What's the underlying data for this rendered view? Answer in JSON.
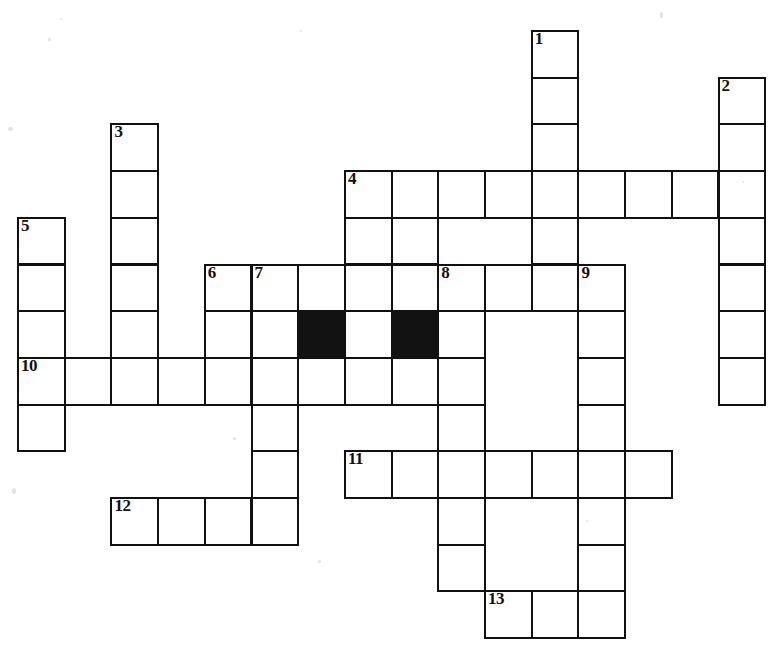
{
  "puzzle": {
    "type": "crossword-grid",
    "title": "Crossword puzzle grid",
    "cell_size": 46.7,
    "origin_x": 17,
    "origin_y": 30,
    "colors": {
      "background": "#ffffff",
      "cell_fill": "#ffffff",
      "block_fill": "#121212",
      "border": "#111111",
      "number": "#111111"
    },
    "numbers_total": 13,
    "numbers": [
      "1",
      "2",
      "3",
      "4",
      "5",
      "6",
      "7",
      "8",
      "9",
      "10",
      "11",
      "12",
      "13"
    ],
    "cells": [
      {
        "c": 11,
        "r": 0,
        "n": "1"
      },
      {
        "c": 11,
        "r": 1,
        "n": ""
      },
      {
        "c": 11,
        "r": 2,
        "n": ""
      },
      {
        "c": 15,
        "r": 1,
        "n": "2"
      },
      {
        "c": 15,
        "r": 2,
        "n": ""
      },
      {
        "c": 2,
        "r": 2,
        "n": "3"
      },
      {
        "c": 2,
        "r": 3,
        "n": ""
      },
      {
        "c": 2,
        "r": 4,
        "n": ""
      },
      {
        "c": 2,
        "r": 5,
        "n": ""
      },
      {
        "c": 2,
        "r": 6,
        "n": ""
      },
      {
        "c": 7,
        "r": 3,
        "n": "4"
      },
      {
        "c": 8,
        "r": 3,
        "n": ""
      },
      {
        "c": 9,
        "r": 3,
        "n": ""
      },
      {
        "c": 10,
        "r": 3,
        "n": ""
      },
      {
        "c": 11,
        "r": 3,
        "n": ""
      },
      {
        "c": 12,
        "r": 3,
        "n": ""
      },
      {
        "c": 13,
        "r": 3,
        "n": ""
      },
      {
        "c": 14,
        "r": 3,
        "n": ""
      },
      {
        "c": 15,
        "r": 3,
        "n": ""
      },
      {
        "c": 7,
        "r": 4,
        "n": ""
      },
      {
        "c": 8,
        "r": 4,
        "n": ""
      },
      {
        "c": 11,
        "r": 4,
        "n": ""
      },
      {
        "c": 15,
        "r": 4,
        "n": ""
      },
      {
        "c": 0,
        "r": 4,
        "n": "5"
      },
      {
        "c": 0,
        "r": 5,
        "n": ""
      },
      {
        "c": 0,
        "r": 6,
        "n": ""
      },
      {
        "c": 4,
        "r": 5,
        "n": "6"
      },
      {
        "c": 5,
        "r": 5,
        "n": "7"
      },
      {
        "c": 6,
        "r": 5,
        "n": ""
      },
      {
        "c": 7,
        "r": 5,
        "n": ""
      },
      {
        "c": 8,
        "r": 5,
        "n": ""
      },
      {
        "c": 9,
        "r": 5,
        "n": "8"
      },
      {
        "c": 10,
        "r": 5,
        "n": ""
      },
      {
        "c": 11,
        "r": 5,
        "n": ""
      },
      {
        "c": 12,
        "r": 5,
        "n": "9"
      },
      {
        "c": 4,
        "r": 6,
        "n": ""
      },
      {
        "c": 5,
        "r": 6,
        "n": ""
      },
      {
        "c": 6,
        "r": 6,
        "n": "",
        "block": true
      },
      {
        "c": 7,
        "r": 6,
        "n": ""
      },
      {
        "c": 8,
        "r": 6,
        "n": "",
        "block": true
      },
      {
        "c": 9,
        "r": 6,
        "n": ""
      },
      {
        "c": 12,
        "r": 6,
        "n": ""
      },
      {
        "c": 15,
        "r": 5,
        "n": ""
      },
      {
        "c": 15,
        "r": 6,
        "n": ""
      },
      {
        "c": 0,
        "r": 7,
        "n": "10"
      },
      {
        "c": 1,
        "r": 7,
        "n": ""
      },
      {
        "c": 2,
        "r": 7,
        "n": ""
      },
      {
        "c": 3,
        "r": 7,
        "n": ""
      },
      {
        "c": 4,
        "r": 7,
        "n": ""
      },
      {
        "c": 5,
        "r": 7,
        "n": ""
      },
      {
        "c": 6,
        "r": 7,
        "n": ""
      },
      {
        "c": 7,
        "r": 7,
        "n": ""
      },
      {
        "c": 8,
        "r": 7,
        "n": ""
      },
      {
        "c": 9,
        "r": 7,
        "n": ""
      },
      {
        "c": 12,
        "r": 7,
        "n": ""
      },
      {
        "c": 15,
        "r": 7,
        "n": ""
      },
      {
        "c": 0,
        "r": 8,
        "n": ""
      },
      {
        "c": 5,
        "r": 8,
        "n": ""
      },
      {
        "c": 9,
        "r": 8,
        "n": ""
      },
      {
        "c": 12,
        "r": 8,
        "n": ""
      },
      {
        "c": 5,
        "r": 9,
        "n": ""
      },
      {
        "c": 9,
        "r": 9,
        "n": ""
      },
      {
        "c": 12,
        "r": 9,
        "n": ""
      },
      {
        "c": 7,
        "r": 9,
        "n": "11"
      },
      {
        "c": 8,
        "r": 9,
        "n": ""
      },
      {
        "c": 10,
        "r": 9,
        "n": ""
      },
      {
        "c": 11,
        "r": 9,
        "n": ""
      },
      {
        "c": 13,
        "r": 9,
        "n": ""
      },
      {
        "c": 2,
        "r": 10,
        "n": "12"
      },
      {
        "c": 3,
        "r": 10,
        "n": ""
      },
      {
        "c": 4,
        "r": 10,
        "n": ""
      },
      {
        "c": 5,
        "r": 10,
        "n": ""
      },
      {
        "c": 9,
        "r": 10,
        "n": ""
      },
      {
        "c": 12,
        "r": 10,
        "n": ""
      },
      {
        "c": 9,
        "r": 11,
        "n": ""
      },
      {
        "c": 12,
        "r": 11,
        "n": ""
      },
      {
        "c": 10,
        "r": 12,
        "n": "13"
      },
      {
        "c": 11,
        "r": 12,
        "n": ""
      },
      {
        "c": 12,
        "r": 12,
        "n": ""
      }
    ],
    "extra_rects": [
      {
        "c": 9,
        "r": 9,
        "w": 1,
        "h": 1
      },
      {
        "c": 10,
        "r": 5,
        "w": 1,
        "h": 1
      }
    ]
  }
}
